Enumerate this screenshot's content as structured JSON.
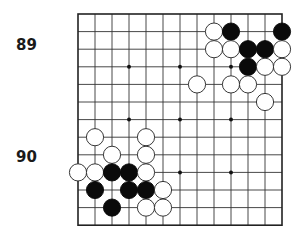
{
  "labels": [
    {
      "text": "89",
      "x": 17,
      "y": 38
    },
    {
      "text": "90",
      "x": 17,
      "y": 150
    }
  ],
  "board": {
    "size": 13,
    "origin_x": 78,
    "origin_y": 14,
    "spacing_x": 17.0,
    "spacing_y": 17.6,
    "stone_radius": 8.6,
    "line_color": "#333333",
    "border_color": "#222222",
    "black_color": "#0a0a0a",
    "white_color": "#ffffff",
    "hoshi": [
      [
        3,
        3
      ],
      [
        3,
        6
      ],
      [
        3,
        9
      ],
      [
        6,
        3
      ],
      [
        6,
        6
      ],
      [
        6,
        9
      ],
      [
        9,
        3
      ],
      [
        9,
        6
      ],
      [
        9,
        9
      ]
    ],
    "stones": [
      {
        "color": "W",
        "col": 8,
        "row": 1
      },
      {
        "color": "B",
        "col": 9,
        "row": 1
      },
      {
        "color": "B",
        "col": 12,
        "row": 1
      },
      {
        "color": "W",
        "col": 8,
        "row": 2
      },
      {
        "color": "W",
        "col": 9,
        "row": 2
      },
      {
        "color": "B",
        "col": 10,
        "row": 2
      },
      {
        "color": "B",
        "col": 11,
        "row": 2
      },
      {
        "color": "W",
        "col": 12,
        "row": 2
      },
      {
        "color": "B",
        "col": 10,
        "row": 3
      },
      {
        "color": "W",
        "col": 11,
        "row": 3
      },
      {
        "color": "W",
        "col": 12,
        "row": 3
      },
      {
        "color": "W",
        "col": 7,
        "row": 4
      },
      {
        "color": "W",
        "col": 9,
        "row": 4
      },
      {
        "color": "W",
        "col": 10,
        "row": 4
      },
      {
        "color": "W",
        "col": 11,
        "row": 5
      },
      {
        "color": "W",
        "col": 1,
        "row": 7
      },
      {
        "color": "W",
        "col": 4,
        "row": 7
      },
      {
        "color": "W",
        "col": 2,
        "row": 8
      },
      {
        "color": "W",
        "col": 4,
        "row": 8
      },
      {
        "color": "W",
        "col": 0,
        "row": 9
      },
      {
        "color": "W",
        "col": 1,
        "row": 9
      },
      {
        "color": "B",
        "col": 2,
        "row": 9
      },
      {
        "color": "B",
        "col": 3,
        "row": 9
      },
      {
        "color": "W",
        "col": 4,
        "row": 9
      },
      {
        "color": "B",
        "col": 1,
        "row": 10
      },
      {
        "color": "B",
        "col": 3,
        "row": 10
      },
      {
        "color": "B",
        "col": 4,
        "row": 10
      },
      {
        "color": "W",
        "col": 5,
        "row": 10
      },
      {
        "color": "B",
        "col": 2,
        "row": 11
      },
      {
        "color": "W",
        "col": 4,
        "row": 11
      },
      {
        "color": "W",
        "col": 5,
        "row": 11
      }
    ]
  }
}
